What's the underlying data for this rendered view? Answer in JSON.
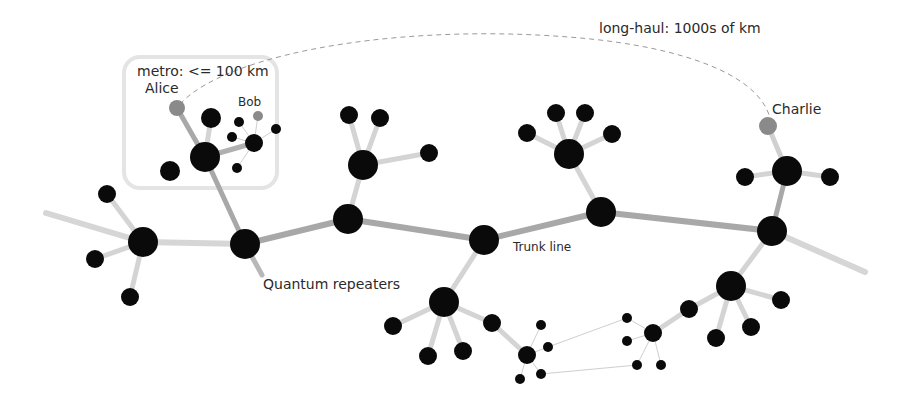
{
  "labels": {
    "metro": "metro: <= 100 km",
    "long_haul": "long-haul: 1000s of km",
    "alice": "Alice",
    "bob": "Bob",
    "charlie": "Charlie",
    "trunk_line": "Trunk line",
    "quantum_repeaters": "Quantum repeaters"
  },
  "colors": {
    "node": "#0a0a0a",
    "endpoint": "#8a8a8a",
    "trunk_link": "#a8a8a8",
    "branch_link": "#d4d4d4",
    "local_link": "#cfcfcf",
    "dashed": "#9a9a9a",
    "box": "#e4e4e4"
  },
  "nodes": [
    {
      "id": "r1",
      "x": 143,
      "y": 242,
      "r": 15,
      "type": "repeater"
    },
    {
      "id": "r2",
      "x": 245,
      "y": 244,
      "r": 15,
      "type": "repeater"
    },
    {
      "id": "r3",
      "x": 348,
      "y": 219,
      "r": 15,
      "type": "repeater"
    },
    {
      "id": "r4",
      "x": 484,
      "y": 240,
      "r": 15,
      "type": "repeater"
    },
    {
      "id": "r5",
      "x": 601,
      "y": 212,
      "r": 15,
      "type": "repeater"
    },
    {
      "id": "r6",
      "x": 772,
      "y": 231,
      "r": 15,
      "type": "repeater"
    },
    {
      "id": "h1",
      "x": 205,
      "y": 157,
      "r": 15,
      "type": "hub"
    },
    {
      "id": "h2",
      "x": 363,
      "y": 165,
      "r": 15,
      "type": "hub"
    },
    {
      "id": "h3",
      "x": 569,
      "y": 154,
      "r": 15,
      "type": "hub"
    },
    {
      "id": "h4",
      "x": 787,
      "y": 171,
      "r": 15,
      "type": "hub"
    },
    {
      "id": "h5",
      "x": 444,
      "y": 302,
      "r": 15,
      "type": "hub"
    },
    {
      "id": "h6",
      "x": 731,
      "y": 286,
      "r": 15,
      "type": "hub"
    },
    {
      "id": "l1",
      "x": 107,
      "y": 194,
      "r": 9
    },
    {
      "id": "l2",
      "x": 95,
      "y": 259,
      "r": 9
    },
    {
      "id": "l3",
      "x": 130,
      "y": 297,
      "r": 9
    },
    {
      "id": "l4",
      "x": 170,
      "y": 171,
      "r": 10
    },
    {
      "id": "l5",
      "x": 211,
      "y": 118,
      "r": 9
    },
    {
      "id": "l6",
      "x": 349,
      "y": 115,
      "r": 9
    },
    {
      "id": "l7",
      "x": 380,
      "y": 118,
      "r": 9
    },
    {
      "id": "l8",
      "x": 429,
      "y": 153,
      "r": 9
    },
    {
      "id": "l9",
      "x": 527,
      "y": 133,
      "r": 9
    },
    {
      "id": "l10",
      "x": 556,
      "y": 113,
      "r": 9
    },
    {
      "id": "l11",
      "x": 585,
      "y": 113,
      "r": 9
    },
    {
      "id": "l12",
      "x": 612,
      "y": 134,
      "r": 9
    },
    {
      "id": "l13",
      "x": 745,
      "y": 177,
      "r": 9
    },
    {
      "id": "l14",
      "x": 830,
      "y": 177,
      "r": 9
    },
    {
      "id": "l15",
      "x": 393,
      "y": 326,
      "r": 9
    },
    {
      "id": "l16",
      "x": 428,
      "y": 356,
      "r": 9
    },
    {
      "id": "l17",
      "x": 463,
      "y": 351,
      "r": 9
    },
    {
      "id": "l18",
      "x": 492,
      "y": 323,
      "r": 9
    },
    {
      "id": "l19",
      "x": 689,
      "y": 309,
      "r": 9
    },
    {
      "id": "l20",
      "x": 716,
      "y": 338,
      "r": 9
    },
    {
      "id": "l21",
      "x": 751,
      "y": 327,
      "r": 9
    },
    {
      "id": "l22",
      "x": 781,
      "y": 300,
      "r": 9
    },
    {
      "id": "l23",
      "x": 689,
      "y": 309,
      "r": 9
    },
    {
      "id": "m1",
      "x": 254,
      "y": 143,
      "r": 9
    },
    {
      "id": "m2",
      "x": 239,
      "y": 122,
      "r": 5
    },
    {
      "id": "m3",
      "x": 232,
      "y": 137,
      "r": 5
    },
    {
      "id": "m4",
      "x": 276,
      "y": 129,
      "r": 5
    },
    {
      "id": "m5",
      "x": 237,
      "y": 168,
      "r": 5
    },
    {
      "id": "s1",
      "x": 527,
      "y": 355,
      "r": 9
    },
    {
      "id": "s2",
      "x": 541,
      "y": 325,
      "r": 5
    },
    {
      "id": "s3",
      "x": 548,
      "y": 347,
      "r": 5
    },
    {
      "id": "s4",
      "x": 520,
      "y": 379,
      "r": 5
    },
    {
      "id": "s5",
      "x": 541,
      "y": 374,
      "r": 5
    },
    {
      "id": "s6",
      "x": 653,
      "y": 333,
      "r": 9
    },
    {
      "id": "s7",
      "x": 627,
      "y": 318,
      "r": 5
    },
    {
      "id": "s8",
      "x": 627,
      "y": 341,
      "r": 5
    },
    {
      "id": "s9",
      "x": 637,
      "y": 365,
      "r": 5
    },
    {
      "id": "s10",
      "x": 661,
      "y": 365,
      "r": 5
    }
  ],
  "endpoints": [
    {
      "id": "alice",
      "x": 177,
      "y": 108,
      "r": 8
    },
    {
      "id": "bob",
      "x": 258,
      "y": 116,
      "r": 5
    },
    {
      "id": "charlie",
      "x": 768,
      "y": 126,
      "r": 9
    }
  ]
}
